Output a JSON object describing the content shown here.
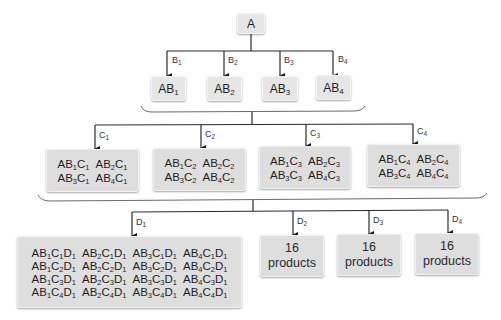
{
  "root": {
    "label": "A"
  },
  "level1": {
    "edges": [
      "B1",
      "B2",
      "B3",
      "B4"
    ],
    "nodes": [
      "AB1",
      "AB2",
      "AB3",
      "AB4"
    ]
  },
  "level2": {
    "edges": [
      "C1",
      "C2",
      "C3",
      "C4"
    ],
    "nodes": [
      {
        "items": [
          "AB1C1",
          "AB2C1",
          "AB3C1",
          "AB4C1"
        ]
      },
      {
        "items": [
          "AB1C2",
          "AB2C2",
          "AB3C2",
          "AB4C2"
        ]
      },
      {
        "items": [
          "AB1C3",
          "AB2C3",
          "AB3C3",
          "AB4C3"
        ]
      },
      {
        "items": [
          "AB1C4",
          "AB2C4",
          "AB3C4",
          "AB4C4"
        ]
      }
    ]
  },
  "level3": {
    "edges": [
      "D1",
      "D2",
      "D3",
      "D4"
    ],
    "expanded_node": {
      "items": [
        "AB1C1D1",
        "AB2C1D1",
        "AB3C1D1",
        "AB4C1D1",
        "AB1C2D1",
        "AB2C2D1",
        "AB3C2D1",
        "AB4C2D1",
        "AB1C3D1",
        "AB2C3D1",
        "AB3C3D1",
        "AB4C3D1",
        "AB1C4D1",
        "AB2C4D1",
        "AB3C4D1",
        "AB4C4D1"
      ]
    },
    "collapsed_nodes": [
      {
        "count": "16",
        "unit": "products"
      },
      {
        "count": "16",
        "unit": "products"
      },
      {
        "count": "16",
        "unit": "products"
      }
    ]
  },
  "colors": {
    "box_fill": "#dedede",
    "line": "#2a2a2a",
    "brace": "#6a6a6a"
  }
}
